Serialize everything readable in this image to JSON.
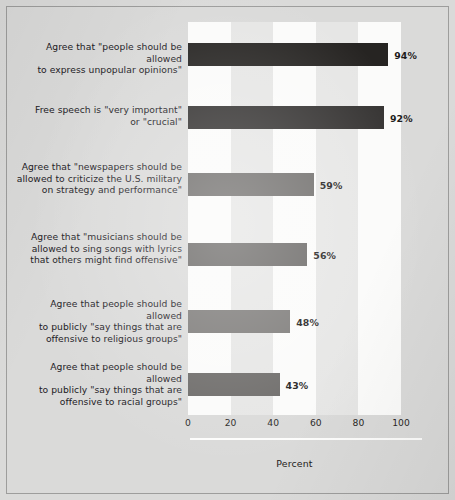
{
  "chart_data": {
    "type": "bar",
    "orientation": "horizontal",
    "title": "",
    "xlabel": "Percent",
    "ylabel": "",
    "xlim": [
      0,
      100
    ],
    "xticks": [
      "0",
      "20",
      "40",
      "60",
      "80",
      "100"
    ],
    "grid": false,
    "legend": "none",
    "background_bands": "alternating white bands at 0-20, 40-60, 80-100",
    "categories": [
      "Agree that \"people should be allowed to express unpopular opinions\"",
      "Free speech is \"very important\" or \"crucial\"",
      "Agree that \"newspapers should be allowed to criticize the U.S. military on strategy and performance\"",
      "Agree that \"musicians should be allowed to sing songs with lyrics that others might find offensive\"",
      "Agree that people should be allowed to publicly \"say things that are offensive to religious groups\"",
      "Agree that people should be allowed to publicly \"say things that are offensive to racial groups\""
    ],
    "values": [
      94,
      92,
      59,
      56,
      48,
      43
    ],
    "value_labels": [
      "94%",
      "92%",
      "59%",
      "56%",
      "48%",
      "43%"
    ],
    "bar_colors": [
      "#262422",
      "#333130",
      "#6f6d6b",
      "#6a6866",
      "#7b7977",
      "#6b6967"
    ]
  },
  "rows": [
    {
      "lines": [
        "Agree that \"people should be allowed",
        "to express unpopular opinions\""
      ],
      "value": 94,
      "value_label": "94%",
      "color": "#262422"
    },
    {
      "lines": [
        "Free speech is \"very important\"",
        "or \"crucial\""
      ],
      "value": 92,
      "value_label": "92%",
      "color": "#333130"
    },
    {
      "lines": [
        "Agree that \"newspapers should be",
        "allowed to criticize the U.S. military",
        "on strategy and performance\""
      ],
      "value": 59,
      "value_label": "59%",
      "color": "#6f6d6b"
    },
    {
      "lines": [
        "Agree that \"musicians should be",
        "allowed to sing songs with lyrics",
        "that others might find offensive\""
      ],
      "value": 56,
      "value_label": "56%",
      "color": "#6a6866"
    },
    {
      "lines": [
        "Agree that people should be allowed",
        "to publicly \"say things that are",
        "offensive to religious groups\""
      ],
      "value": 48,
      "value_label": "48%",
      "color": "#7b7977"
    },
    {
      "lines": [
        "Agree that people should be allowed",
        "to publicly \"say things that are",
        "offensive to racial groups\""
      ],
      "value": 43,
      "value_label": "43%",
      "color": "#6b6967"
    }
  ],
  "axis": {
    "ticks": [
      "0",
      "20",
      "40",
      "60",
      "80",
      "100"
    ],
    "tick_values": [
      0,
      20,
      40,
      60,
      80,
      100
    ],
    "title": "Percent"
  },
  "colors": {
    "page_background": "#dadad9",
    "plot_band_gray": "#e6e6e5",
    "plot_band_white": "#fbfbfa",
    "frame_border": "#9d9d9c",
    "text": "#22201f"
  }
}
